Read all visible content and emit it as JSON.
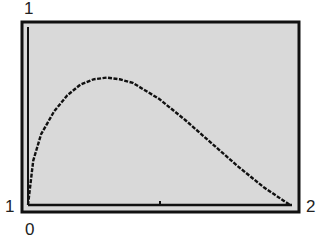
{
  "labels": {
    "y_top": "1",
    "y_left_bottom": "1",
    "x_right": "2",
    "x_origin": "0"
  },
  "chart_data": {
    "type": "line",
    "title": "",
    "xlabel": "",
    "ylabel": "",
    "xlim": [
      1,
      2
    ],
    "ylim": [
      0,
      1
    ],
    "grid": false,
    "series": [
      {
        "name": "curve",
        "x": [
          1.0,
          1.02,
          1.05,
          1.1,
          1.15,
          1.2,
          1.25,
          1.3,
          1.35,
          1.4,
          1.5,
          1.6,
          1.7,
          1.8,
          1.9,
          2.0
        ],
        "y": [
          0.0,
          0.25,
          0.4,
          0.53,
          0.62,
          0.68,
          0.71,
          0.72,
          0.71,
          0.69,
          0.6,
          0.48,
          0.35,
          0.22,
          0.1,
          0.0
        ]
      }
    ],
    "annotations": [
      "1 (top-left, y max)",
      "1 (bottom-left, x min)",
      "2 (bottom-right, x max)",
      "0 (below origin, y min)"
    ]
  }
}
